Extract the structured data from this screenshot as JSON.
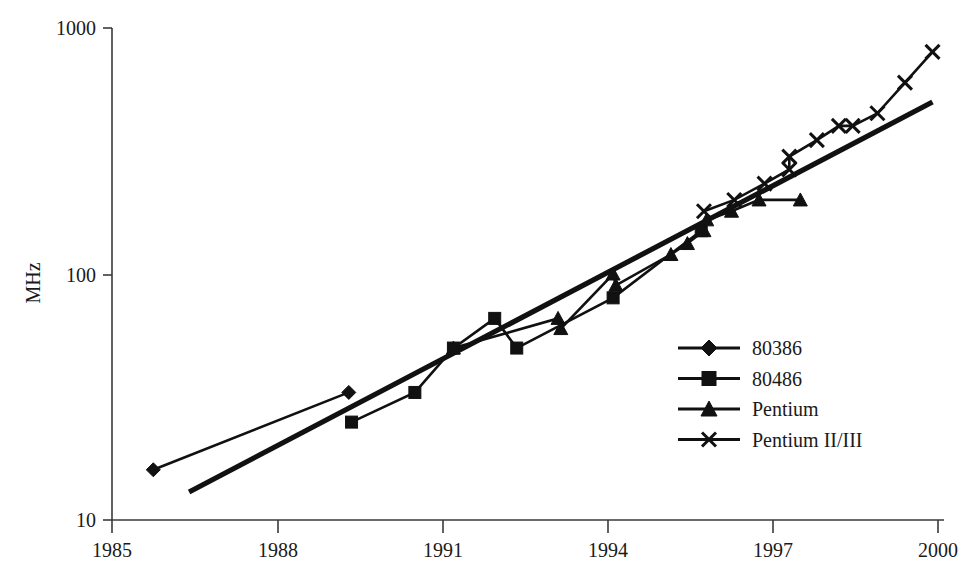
{
  "chart_data": {
    "type": "line",
    "title": "",
    "subtitle": "",
    "xlabel": "",
    "ylabel": "MHz",
    "xlim": [
      1985,
      2000
    ],
    "ylim": [
      10,
      1000
    ],
    "yscale": "log",
    "xscale": "linear",
    "grid": false,
    "legend_position": "inside-lower-right",
    "xticks": [
      1985,
      1988,
      1991,
      1994,
      1997,
      2000
    ],
    "xtick_labels": [
      "1985",
      "1988",
      "1991",
      "1994",
      "1997",
      "2000"
    ],
    "yticks": [
      10,
      100,
      1000
    ],
    "ytick_labels": [
      "10",
      "100",
      "1000"
    ],
    "series": [
      {
        "name": "80386",
        "marker": "diamond",
        "x": [
          1985.75,
          1989.3
        ],
        "values": [
          16,
          33
        ]
      },
      {
        "name": "80486",
        "marker": "square",
        "x": [
          1989.35,
          1990.5,
          1991.2,
          1991.95,
          1992.35,
          1994.1,
          1995.7
        ],
        "values": [
          25,
          33,
          50,
          66,
          50,
          80,
          150
        ]
      },
      {
        "name": "Pentium",
        "marker": "triangle",
        "x": [
          1991.2,
          1993.1,
          1993.15,
          1994.1,
          1994.15,
          1995.15,
          1995.45,
          1995.75,
          1995.8,
          1996.25,
          1996.75,
          1997.5
        ],
        "values": [
          50,
          66,
          60,
          100,
          90,
          120,
          133,
          150,
          166,
          180,
          200,
          200
        ]
      },
      {
        "name": "Pentium II/III",
        "marker": "x",
        "x": [
          1995.75,
          1996.3,
          1996.85,
          1997.3,
          1997.3,
          1997.8,
          1998.2,
          1998.45,
          1998.9,
          1999.4,
          1999.9
        ],
        "values": [
          180,
          200,
          233,
          266,
          300,
          350,
          400,
          400,
          450,
          600,
          800
        ]
      }
    ],
    "trend_line": {
      "name": "exponential-trend",
      "x": [
        1986.4,
        1999.9
      ],
      "values": [
        13,
        500
      ]
    },
    "legend": [
      {
        "label": "80386",
        "marker": "diamond"
      },
      {
        "label": "80486",
        "marker": "square"
      },
      {
        "label": "Pentium",
        "marker": "triangle"
      },
      {
        "label": "Pentium II/III",
        "marker": "x"
      }
    ]
  }
}
